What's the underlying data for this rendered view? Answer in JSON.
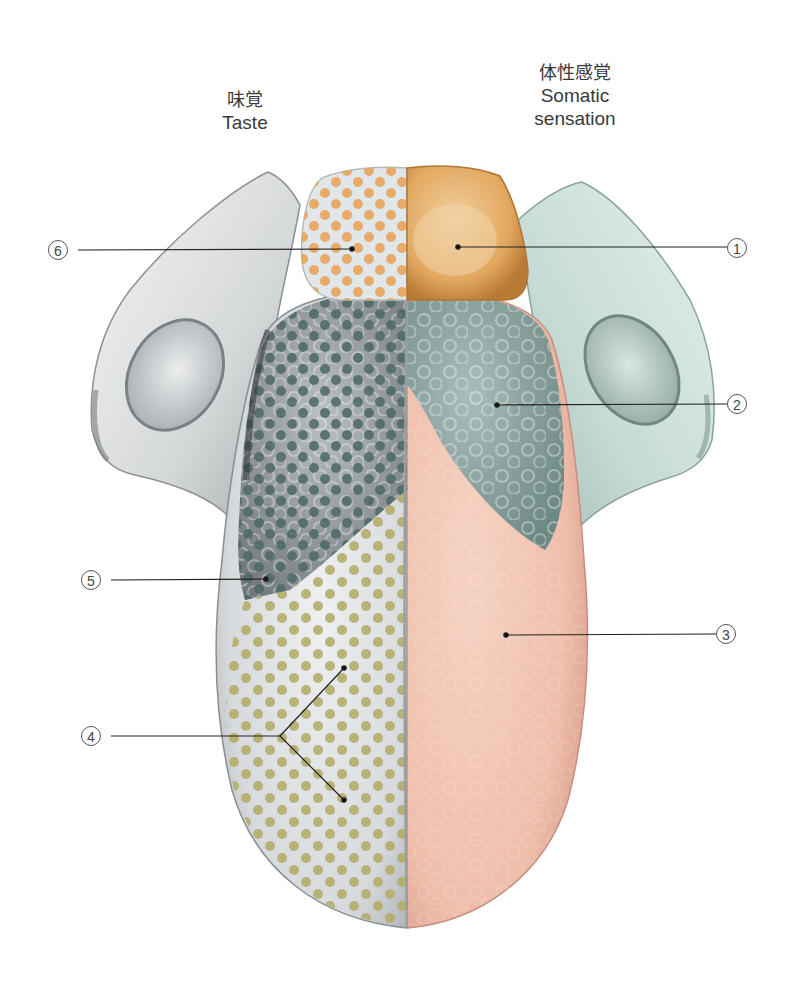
{
  "diagram": {
    "headers": {
      "taste": {
        "jp": "味覚",
        "en": "Taste"
      },
      "somatic": {
        "jp": "体性感覚",
        "en": "Somatic sensation"
      }
    },
    "colors": {
      "background": "#ffffff",
      "taste_side_base": "#d7dbdd",
      "somatic_tip": "#f2c6b4",
      "somatic_root": "#8fa6a2",
      "somatic_tonsil_region": "#c7ddd8",
      "epiglottis_somatic": "#d9a055",
      "epiglottis_taste_dots": "#e8a35a",
      "posterior_taste_dots": "#4d6764",
      "anterior_taste_dots": "#b5ad6a",
      "leader_line": "#222222"
    },
    "callouts": [
      {
        "number": "1",
        "glyph": "①",
        "side": "right",
        "region": "epiglottis (somatic)",
        "label_xy": [
          736,
          248
        ],
        "point_xy": [
          458,
          247
        ]
      },
      {
        "number": "2",
        "glyph": "②",
        "side": "right",
        "region": "posterior tongue root (somatic)",
        "label_xy": [
          736,
          404
        ],
        "point_xy": [
          497,
          405
        ]
      },
      {
        "number": "3",
        "glyph": "③",
        "side": "right",
        "region": "anterior two-thirds (somatic)",
        "label_xy": [
          726,
          634
        ],
        "point_xy": [
          506,
          635
        ]
      },
      {
        "number": "4",
        "glyph": "④",
        "side": "left",
        "region": "anterior two-thirds (taste)",
        "label_xy": [
          90,
          736
        ],
        "point_xy": [
          [
            344,
            668
          ],
          [
            344,
            800
          ]
        ]
      },
      {
        "number": "5",
        "glyph": "⑤",
        "side": "left",
        "region": "posterior third (taste)",
        "label_xy": [
          90,
          580
        ],
        "point_xy": [
          266,
          579
        ]
      },
      {
        "number": "6",
        "glyph": "⑥",
        "side": "left",
        "region": "epiglottis (taste)",
        "label_xy": [
          58,
          250
        ],
        "point_xy": [
          352,
          249
        ]
      }
    ]
  }
}
